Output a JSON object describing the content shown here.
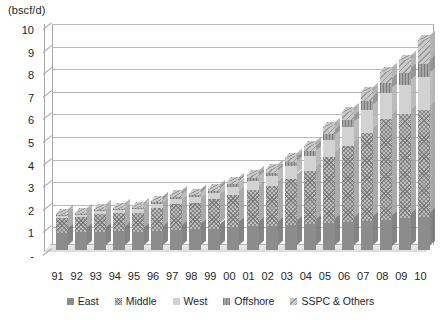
{
  "chart_data": {
    "type": "bar",
    "subtype": "stacked-column-3d",
    "title": "",
    "xlabel": "",
    "ylabel": "(bscf/d)",
    "ylim": [
      0,
      10
    ],
    "yticks": [
      "-",
      "1",
      "2",
      "3",
      "4",
      "5",
      "6",
      "7",
      "8",
      "9",
      "10"
    ],
    "grid": true,
    "legend_position": "bottom",
    "categories": [
      "91",
      "92",
      "93",
      "94",
      "95",
      "96",
      "97",
      "98",
      "99",
      "00",
      "01",
      "02",
      "03",
      "04",
      "05",
      "06",
      "07",
      "08",
      "09",
      "10"
    ],
    "series": [
      {
        "name": "East",
        "values": [
          0.75,
          0.78,
          0.8,
          0.82,
          0.8,
          0.85,
          0.9,
          0.92,
          0.95,
          1.0,
          1.05,
          1.08,
          1.1,
          1.15,
          1.2,
          1.25,
          1.3,
          1.35,
          1.4,
          1.45
        ]
      },
      {
        "name": "Middle",
        "values": [
          0.65,
          0.67,
          0.78,
          0.8,
          0.82,
          1.0,
          1.15,
          1.18,
          1.3,
          1.45,
          1.6,
          1.75,
          2.05,
          2.35,
          2.9,
          3.35,
          3.9,
          4.45,
          4.6,
          4.75
        ]
      },
      {
        "name": "West",
        "values": [
          0.1,
          0.1,
          0.15,
          0.15,
          0.18,
          0.2,
          0.22,
          0.25,
          0.28,
          0.35,
          0.4,
          0.45,
          0.55,
          0.65,
          0.75,
          0.85,
          1.0,
          1.15,
          1.3,
          1.45
        ]
      },
      {
        "name": "Offshore",
        "values": [
          0.05,
          0.05,
          0.05,
          0.06,
          0.06,
          0.07,
          0.08,
          0.08,
          0.09,
          0.1,
          0.12,
          0.14,
          0.18,
          0.22,
          0.28,
          0.32,
          0.38,
          0.45,
          0.52,
          0.6
        ]
      },
      {
        "name": "SSPC & Others",
        "values": [
          0.05,
          0.05,
          0.05,
          0.05,
          0.06,
          0.06,
          0.07,
          0.07,
          0.08,
          0.1,
          0.13,
          0.15,
          0.2,
          0.25,
          0.3,
          0.35,
          0.42,
          0.5,
          0.6,
          1.05
        ]
      }
    ],
    "totals": [
      1.6,
      1.65,
      1.83,
      1.88,
      1.92,
      2.18,
      2.42,
      2.5,
      2.7,
      3.0,
      3.3,
      3.57,
      4.08,
      4.62,
      5.43,
      6.12,
      7.0,
      7.9,
      8.42,
      9.3
    ],
    "colors": {
      "East": "#8c8c8c",
      "Middle": "#bdbdbd",
      "West": "#d2d2d2",
      "Offshore": "#a6a6a6",
      "SSPC & Others": "#c9c9c9"
    }
  },
  "legend": {
    "items": [
      {
        "label": "East",
        "key": "east-legend-key"
      },
      {
        "label": "Middle",
        "key": "middle-legend-key"
      },
      {
        "label": "West",
        "key": "west-legend-key"
      },
      {
        "label": "Offshore",
        "key": "offshore-legend-key"
      },
      {
        "label": "SSPC & Others",
        "key": "sspc-legend-key"
      }
    ]
  }
}
